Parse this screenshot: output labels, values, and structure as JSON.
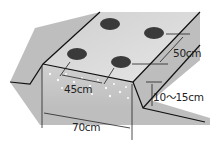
{
  "diagram": {
    "labels": {
      "bed_width": "70cm",
      "plant_spacing_across": "45cm",
      "plant_spacing_along": "50cm",
      "bed_height": "10〜15cm"
    },
    "plants_count": 4,
    "colors": {
      "soil_light": "#d8d8d8",
      "soil_dark": "#a9a9a9",
      "plant_hole": "#3a3a3a",
      "outline": "#111111"
    }
  }
}
